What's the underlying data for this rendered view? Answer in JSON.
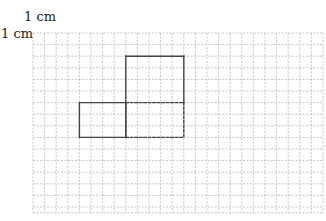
{
  "labels": {
    "horizontal_unit": "1 cm",
    "vertical_unit": "1 cm"
  },
  "grid": {
    "origin_x": 33,
    "origin_y": 33,
    "cell": 11.6,
    "cols": 25,
    "rows": 15.5,
    "line_color": "#b8b8b8"
  },
  "shapes": [
    {
      "name": "upper-rectangle",
      "style": "solid",
      "col": 8,
      "row": 2,
      "w": 5,
      "h": 4,
      "open_side": "bottom"
    },
    {
      "name": "left-rectangle",
      "style": "solid",
      "col": 4,
      "row": 6,
      "w": 4,
      "h": 3
    },
    {
      "name": "dashed-rectangle",
      "style": "dashed",
      "col": 8,
      "row": 6,
      "w": 5,
      "h": 3
    }
  ],
  "colors": {
    "shape_stroke": "#444444"
  }
}
